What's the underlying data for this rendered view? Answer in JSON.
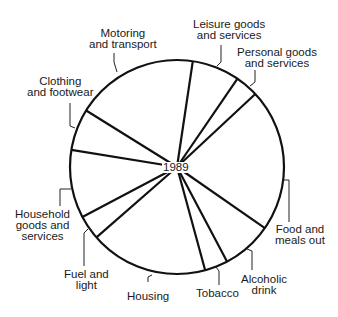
{
  "chart_data": {
    "type": "pie",
    "title": "",
    "center_label": "1989",
    "start_angle_deg": 8.5,
    "direction": "clockwise",
    "unit": "percent of spending (estimated from slice angles)",
    "slices": [
      {
        "label": "Leisure goods and services",
        "value": 7.2
      },
      {
        "label": "Personal goods and services",
        "value": 3.5
      },
      {
        "label": "Food and meals out",
        "value": 21.6
      },
      {
        "label": "Alcoholic drink",
        "value": 7.6
      },
      {
        "label": "Tobacco",
        "value": 3.5
      },
      {
        "label": "Housing",
        "value": 17.8
      },
      {
        "label": "Fuel and light",
        "value": 3.7
      },
      {
        "label": "Household goods and services",
        "value": 10.3
      },
      {
        "label": "Clothing and footwear",
        "value": 6.3
      },
      {
        "label": "Motoring and transport",
        "value": 18.5
      }
    ],
    "legend": "none (direct labels with leader lines)",
    "colors": {
      "stroke": "#111111",
      "fill": "#ffffff"
    }
  },
  "labels": {
    "leisure": [
      "Leisure goods",
      "and services"
    ],
    "personal": [
      "Personal goods",
      "and services"
    ],
    "food": [
      "Food and",
      "meals out"
    ],
    "alcohol": [
      "Alcoholic",
      "drink"
    ],
    "tobacco": [
      "Tobacco"
    ],
    "housing": [
      "Housing"
    ],
    "fuel": [
      "Fuel and",
      "light"
    ],
    "household": [
      "Household",
      "goods and",
      "services"
    ],
    "clothing": [
      "Clothing",
      "and footwear"
    ],
    "motoring": [
      "Motoring",
      "and transport"
    ]
  }
}
